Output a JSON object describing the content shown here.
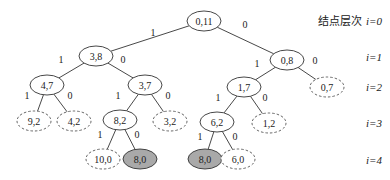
{
  "diagram": {
    "type": "binary-tree",
    "legend_title": "结点层次",
    "levels": [
      {
        "label": "i=0",
        "y": 21
      },
      {
        "label": "i=1",
        "y": 57
      },
      {
        "label": "i=2",
        "y": 87
      },
      {
        "label": "i=3",
        "y": 123
      },
      {
        "label": "i=4",
        "y": 160
      }
    ],
    "nodes": [
      {
        "id": "n0",
        "label": "0,11",
        "x": 204,
        "y": 21,
        "style": "solid"
      },
      {
        "id": "n1",
        "label": "3,8",
        "x": 96,
        "y": 56,
        "style": "solid"
      },
      {
        "id": "n2",
        "label": "0,8",
        "x": 287,
        "y": 60,
        "style": "solid"
      },
      {
        "id": "n3",
        "label": "4,7",
        "x": 47,
        "y": 85,
        "style": "solid"
      },
      {
        "id": "n4",
        "label": "3,7",
        "x": 145,
        "y": 85,
        "style": "solid"
      },
      {
        "id": "n5",
        "label": "1,7",
        "x": 244,
        "y": 87,
        "style": "solid"
      },
      {
        "id": "n6",
        "label": "0,7",
        "x": 327,
        "y": 87,
        "style": "dashed"
      },
      {
        "id": "n7",
        "label": "9,2",
        "x": 34,
        "y": 121,
        "style": "dashed"
      },
      {
        "id": "n8",
        "label": "4,2",
        "x": 74,
        "y": 121,
        "style": "dashed"
      },
      {
        "id": "n9",
        "label": "8,2",
        "x": 120,
        "y": 120,
        "style": "solid"
      },
      {
        "id": "n10",
        "label": "3,2",
        "x": 170,
        "y": 121,
        "style": "dashed"
      },
      {
        "id": "n11",
        "label": "6,2",
        "x": 217,
        "y": 122,
        "style": "solid"
      },
      {
        "id": "n12",
        "label": "1,2",
        "x": 269,
        "y": 123,
        "style": "dashed"
      },
      {
        "id": "n13",
        "label": "10,0",
        "x": 103,
        "y": 159,
        "style": "dashed"
      },
      {
        "id": "n14",
        "label": "8,0",
        "x": 140,
        "y": 159,
        "style": "filled"
      },
      {
        "id": "n15",
        "label": "8,0",
        "x": 205,
        "y": 159,
        "style": "filled"
      },
      {
        "id": "n16",
        "label": "6,0",
        "x": 238,
        "y": 159,
        "style": "dashed"
      }
    ],
    "edges": [
      {
        "from": "n0",
        "to": "n1",
        "label": "1",
        "lx": 153,
        "ly": 36
      },
      {
        "from": "n0",
        "to": "n2",
        "label": "0",
        "lx": 245,
        "ly": 28
      },
      {
        "from": "n1",
        "to": "n3",
        "label": "1",
        "lx": 61,
        "ly": 63
      },
      {
        "from": "n1",
        "to": "n4",
        "label": "0",
        "lx": 123,
        "ly": 63
      },
      {
        "from": "n2",
        "to": "n5",
        "label": "1",
        "lx": 257,
        "ly": 67
      },
      {
        "from": "n2",
        "to": "n6",
        "label": "0",
        "lx": 315,
        "ly": 64
      },
      {
        "from": "n3",
        "to": "n7",
        "label": "1",
        "lx": 27,
        "ly": 99
      },
      {
        "from": "n3",
        "to": "n8",
        "label": "0",
        "lx": 70,
        "ly": 99
      },
      {
        "from": "n4",
        "to": "n9",
        "label": "1",
        "lx": 118,
        "ly": 99
      },
      {
        "from": "n4",
        "to": "n10",
        "label": "0",
        "lx": 168,
        "ly": 99
      },
      {
        "from": "n5",
        "to": "n11",
        "label": "1",
        "lx": 218,
        "ly": 101
      },
      {
        "from": "n5",
        "to": "n12",
        "label": "0",
        "lx": 265,
        "ly": 101
      },
      {
        "from": "n9",
        "to": "n13",
        "label": "1",
        "lx": 100,
        "ly": 138
      },
      {
        "from": "n9",
        "to": "n14",
        "label": "0",
        "lx": 137,
        "ly": 138
      },
      {
        "from": "n11",
        "to": "n15",
        "label": "1",
        "lx": 200,
        "ly": 140
      },
      {
        "from": "n11",
        "to": "n16",
        "label": "0",
        "lx": 235,
        "ly": 140
      }
    ]
  },
  "colors": {
    "stroke": "#333333",
    "dashed_stroke": "#555555",
    "filled_node": "#a9a9a9",
    "background": "#ffffff"
  }
}
